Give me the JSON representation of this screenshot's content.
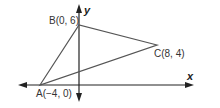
{
  "diagram": {
    "type": "coordinate-triangle",
    "axes": {
      "x_label": "x",
      "y_label": "y",
      "color": "#222222"
    },
    "triangle": {
      "stroke_color": "#555555",
      "vertices": [
        {
          "name": "A",
          "label": "A(−4, 0)",
          "x": -4,
          "y": 0
        },
        {
          "name": "B",
          "label": "B(0, 6)",
          "x": 0,
          "y": 6
        },
        {
          "name": "C",
          "label": "C(8, 4)",
          "x": 8,
          "y": 4
        }
      ]
    }
  }
}
